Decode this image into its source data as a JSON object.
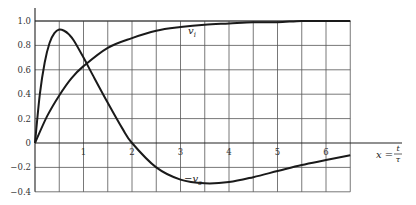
{
  "chart_data": {
    "type": "line",
    "title": "",
    "xlabel": "x = t/τ",
    "ylabel": "",
    "xlim": [
      0,
      6.5
    ],
    "ylim": [
      -0.4,
      1.0
    ],
    "grid": true,
    "x_ticks": [
      "1",
      "2",
      "3",
      "4",
      "5",
      "6"
    ],
    "y_ticks": [
      "1.0",
      "0.8",
      "0.6",
      "0.4",
      "0.2",
      "0",
      "−0.2",
      "−0.4"
    ],
    "series": [
      {
        "name": "v_i",
        "label": "v",
        "subscript": "i",
        "x": [
          0,
          0.25,
          0.5,
          0.75,
          1.0,
          1.5,
          2.0,
          2.5,
          3.0,
          3.5,
          4.0,
          4.5,
          5.0,
          5.5,
          6.0,
          6.5
        ],
        "values": [
          0,
          0.22,
          0.39,
          0.53,
          0.63,
          0.78,
          0.86,
          0.92,
          0.95,
          0.97,
          0.98,
          0.99,
          0.99,
          1.0,
          1.0,
          1.0
        ]
      },
      {
        "name": "-v_o",
        "label": "−v",
        "subscript": "o",
        "x": [
          0,
          0.1,
          0.2,
          0.3,
          0.4,
          0.5,
          0.6,
          0.7,
          0.8,
          1.0,
          1.2,
          1.5,
          1.8,
          2.0,
          2.5,
          3.0,
          3.5,
          4.0,
          4.5,
          5.0,
          5.5,
          6.0,
          6.5
        ],
        "values": [
          0,
          0.4,
          0.66,
          0.82,
          0.9,
          0.93,
          0.92,
          0.89,
          0.84,
          0.7,
          0.55,
          0.33,
          0.12,
          0.0,
          -0.2,
          -0.3,
          -0.33,
          -0.32,
          -0.28,
          -0.23,
          -0.18,
          -0.14,
          -0.1
        ]
      }
    ]
  }
}
